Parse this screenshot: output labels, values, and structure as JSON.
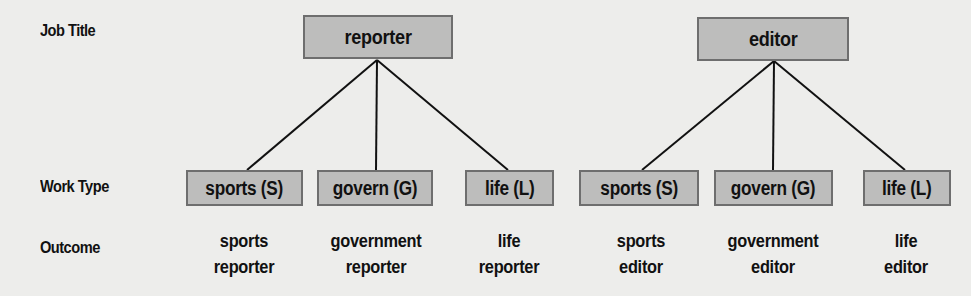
{
  "row_labels": {
    "job_title": "Job Title",
    "work_type": "Work Type",
    "outcome": "Outcome"
  },
  "trees": [
    {
      "job_title": "reporter",
      "work_types": [
        "sports (S)",
        "govern (G)",
        "life (L)"
      ],
      "outcomes": [
        {
          "line1": "sports",
          "line2": "reporter"
        },
        {
          "line1": "government",
          "line2": "reporter"
        },
        {
          "line1": "life",
          "line2": "reporter"
        }
      ]
    },
    {
      "job_title": "editor",
      "work_types": [
        "sports (S)",
        "govern (G)",
        "life (L)"
      ],
      "outcomes": [
        {
          "line1": "sports",
          "line2": "editor"
        },
        {
          "line1": "government",
          "line2": "editor"
        },
        {
          "line1": "life",
          "line2": "editor"
        }
      ]
    }
  ],
  "colors": {
    "background": "#ededeb",
    "box_fill": "#bdbdbc",
    "box_border": "#6e6e6e",
    "line": "#111111"
  }
}
